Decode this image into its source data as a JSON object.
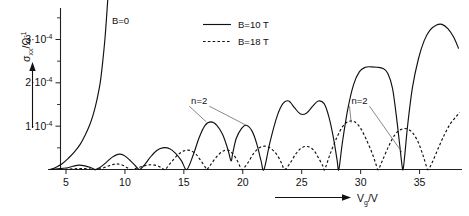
{
  "figure": {
    "title": "",
    "background": "#ffffff",
    "ink": "#111111"
  },
  "axes": {
    "x": {
      "label_main": "V",
      "label_sub": "g",
      "label_unit": "/V",
      "label_full": "Vg /V",
      "ticks": [
        5,
        10,
        15,
        20,
        25,
        30,
        35
      ],
      "tick_labels": [
        "5",
        "10",
        "15",
        "20",
        "25",
        "30",
        "35"
      ],
      "range": [
        2.2,
        38.6
      ],
      "has_arrow": true
    },
    "y": {
      "label_main": "σ",
      "label_sub": "xx",
      "label_unit": "/Ω",
      "label_exp": "-1",
      "label_full": "σxx/Ω-1",
      "ticks": [
        1,
        2,
        3
      ],
      "tick_labels": [
        "1·10",
        "2·10",
        "3·10"
      ],
      "tick_exponent": "-4",
      "minor_ticks": [
        0.5,
        1.5,
        2.5,
        3.5
      ],
      "range": [
        0,
        3.75
      ],
      "unit_scale": "1e-4",
      "has_arrow": true
    }
  },
  "legend": {
    "position": "top-center",
    "items": [
      {
        "label": "B=10 T",
        "style": "solid"
      },
      {
        "label": "B=18 T",
        "style": "dotted"
      }
    ]
  },
  "annotations": [
    {
      "id": "b-zero",
      "text": "B=0",
      "x": 8.9,
      "y": 3.35
    },
    {
      "id": "n-two-left",
      "text": "n=2",
      "x": 16.3,
      "y": 1.52
    },
    {
      "id": "n-two-right",
      "text": "n=2",
      "x": 29.9,
      "y": 1.52
    }
  ],
  "chart_data": {
    "type": "line",
    "title": "",
    "xlabel": "Vg /V",
    "ylabel": "σxx/Ω-1",
    "xlim": [
      2.2,
      38.6
    ],
    "ylim": [
      0,
      3.75
    ],
    "y_unit": "1e-4 Ω^-1",
    "grid": false,
    "legend_position": "top-center",
    "series": [
      {
        "name": "B=0",
        "style": "solid",
        "labelled_in_plot": true,
        "points": [
          [
            3.7,
            0.0
          ],
          [
            4.2,
            0.06
          ],
          [
            4.7,
            0.14
          ],
          [
            5.2,
            0.26
          ],
          [
            5.7,
            0.4
          ],
          [
            6.2,
            0.58
          ],
          [
            6.6,
            0.78
          ],
          [
            7.0,
            1.02
          ],
          [
            7.3,
            1.26
          ],
          [
            7.6,
            1.58
          ],
          [
            7.9,
            2.0
          ],
          [
            8.1,
            2.45
          ],
          [
            8.3,
            3.0
          ],
          [
            8.45,
            3.55
          ],
          [
            8.55,
            3.95
          ]
        ]
      },
      {
        "name": "B=10 T",
        "style": "solid",
        "points": [
          [
            3.6,
            0.0
          ],
          [
            4.3,
            0.015
          ],
          [
            5.0,
            0.035
          ],
          [
            5.6,
            0.075
          ],
          [
            6.1,
            0.1
          ],
          [
            6.6,
            0.085
          ],
          [
            7.1,
            0.045
          ],
          [
            7.5,
            0.0
          ],
          [
            7.9,
            0.05
          ],
          [
            8.4,
            0.16
          ],
          [
            8.9,
            0.28
          ],
          [
            9.4,
            0.35
          ],
          [
            9.9,
            0.33
          ],
          [
            10.4,
            0.22
          ],
          [
            10.9,
            0.08
          ],
          [
            11.25,
            0.0
          ],
          [
            11.7,
            0.12
          ],
          [
            12.2,
            0.3
          ],
          [
            12.7,
            0.44
          ],
          [
            13.2,
            0.5
          ],
          [
            13.8,
            0.48
          ],
          [
            14.3,
            0.37
          ],
          [
            14.8,
            0.2
          ],
          [
            15.25,
            0.0
          ],
          [
            15.8,
            0.34
          ],
          [
            16.3,
            0.74
          ],
          [
            16.8,
            1.02
          ],
          [
            17.3,
            1.1
          ],
          [
            17.8,
            1.02
          ],
          [
            18.3,
            0.8
          ],
          [
            18.75,
            0.45
          ],
          [
            19.0,
            0.2
          ],
          [
            19.15,
            0.38
          ],
          [
            19.45,
            0.72
          ],
          [
            19.9,
            0.95
          ],
          [
            20.3,
            1.02
          ],
          [
            20.8,
            0.88
          ],
          [
            21.2,
            0.58
          ],
          [
            21.55,
            0.2
          ],
          [
            21.8,
            0.0
          ],
          [
            22.3,
            0.62
          ],
          [
            22.9,
            1.22
          ],
          [
            23.4,
            1.52
          ],
          [
            23.9,
            1.58
          ],
          [
            24.4,
            1.42
          ],
          [
            24.9,
            1.28
          ],
          [
            25.4,
            1.3
          ],
          [
            25.9,
            1.45
          ],
          [
            26.4,
            1.58
          ],
          [
            26.9,
            1.52
          ],
          [
            27.3,
            1.22
          ],
          [
            27.7,
            0.72
          ],
          [
            28.0,
            0.22
          ],
          [
            28.15,
            0.0
          ],
          [
            28.45,
            0.62
          ],
          [
            28.9,
            1.38
          ],
          [
            29.4,
            1.96
          ],
          [
            29.9,
            2.26
          ],
          [
            30.4,
            2.36
          ],
          [
            30.9,
            2.37
          ],
          [
            31.4,
            2.36
          ],
          [
            31.9,
            2.33
          ],
          [
            32.3,
            2.22
          ],
          [
            32.7,
            1.88
          ],
          [
            33.0,
            1.3
          ],
          [
            33.3,
            0.6
          ],
          [
            33.5,
            0.12
          ],
          [
            33.6,
            0.0
          ],
          [
            33.75,
            0.35
          ],
          [
            34.0,
            1.05
          ],
          [
            34.4,
            1.9
          ],
          [
            34.9,
            2.55
          ],
          [
            35.4,
            2.98
          ],
          [
            35.9,
            3.22
          ],
          [
            36.4,
            3.33
          ],
          [
            36.9,
            3.35
          ],
          [
            37.4,
            3.25
          ],
          [
            37.9,
            3.05
          ],
          [
            38.3,
            2.8
          ]
        ]
      },
      {
        "name": "B=18 T",
        "style": "dotted",
        "points": [
          [
            4.5,
            0.0
          ],
          [
            5.3,
            0.01
          ],
          [
            6.0,
            0.02
          ],
          [
            6.6,
            0.02
          ],
          [
            7.2,
            0.01
          ],
          [
            7.6,
            0.0
          ],
          [
            8.2,
            0.04
          ],
          [
            8.8,
            0.1
          ],
          [
            9.3,
            0.13
          ],
          [
            9.8,
            0.1
          ],
          [
            10.2,
            0.04
          ],
          [
            10.5,
            0.0
          ],
          [
            11.1,
            0.04
          ],
          [
            11.7,
            0.09
          ],
          [
            12.2,
            0.11
          ],
          [
            12.7,
            0.09
          ],
          [
            13.1,
            0.04
          ],
          [
            13.4,
            0.0
          ],
          [
            13.9,
            0.16
          ],
          [
            14.5,
            0.34
          ],
          [
            15.0,
            0.43
          ],
          [
            15.5,
            0.44
          ],
          [
            16.0,
            0.36
          ],
          [
            16.4,
            0.22
          ],
          [
            16.8,
            0.06
          ],
          [
            16.95,
            0.0
          ],
          [
            17.3,
            0.12
          ],
          [
            17.8,
            0.3
          ],
          [
            18.3,
            0.42
          ],
          [
            18.7,
            0.45
          ],
          [
            19.1,
            0.38
          ],
          [
            19.5,
            0.22
          ],
          [
            19.8,
            0.05
          ],
          [
            19.95,
            0.0
          ],
          [
            20.4,
            0.14
          ],
          [
            20.9,
            0.36
          ],
          [
            21.4,
            0.5
          ],
          [
            21.9,
            0.54
          ],
          [
            22.4,
            0.48
          ],
          [
            22.9,
            0.34
          ],
          [
            23.3,
            0.14
          ],
          [
            23.55,
            0.0
          ],
          [
            24.0,
            0.14
          ],
          [
            24.5,
            0.36
          ],
          [
            25.0,
            0.5
          ],
          [
            25.5,
            0.53
          ],
          [
            26.0,
            0.45
          ],
          [
            26.4,
            0.28
          ],
          [
            26.8,
            0.08
          ],
          [
            26.95,
            0.0
          ],
          [
            27.4,
            0.35
          ],
          [
            28.0,
            0.75
          ],
          [
            28.5,
            1.0
          ],
          [
            29.0,
            1.11
          ],
          [
            29.5,
            1.1
          ],
          [
            30.0,
            0.95
          ],
          [
            30.5,
            0.68
          ],
          [
            31.0,
            0.36
          ],
          [
            31.35,
            0.08
          ],
          [
            31.5,
            0.0
          ],
          [
            31.9,
            0.24
          ],
          [
            32.4,
            0.55
          ],
          [
            32.9,
            0.8
          ],
          [
            33.4,
            0.92
          ],
          [
            33.9,
            0.94
          ],
          [
            34.4,
            0.85
          ],
          [
            34.9,
            0.62
          ],
          [
            35.3,
            0.32
          ],
          [
            35.6,
            0.06
          ],
          [
            35.75,
            0.0
          ],
          [
            36.1,
            0.18
          ],
          [
            36.6,
            0.5
          ],
          [
            37.1,
            0.8
          ],
          [
            37.6,
            1.05
          ],
          [
            38.1,
            1.22
          ],
          [
            38.4,
            1.32
          ]
        ]
      }
    ],
    "annotations": [
      {
        "text": "B=0",
        "target_series": "B=0"
      },
      {
        "text": "n=2",
        "targets": [
          [
            16.9,
            1.1
          ],
          [
            20.3,
            1.02
          ]
        ]
      },
      {
        "text": "n=2",
        "targets": [
          [
            29.2,
            1.08
          ],
          [
            33.5,
            0.4
          ]
        ]
      }
    ]
  }
}
